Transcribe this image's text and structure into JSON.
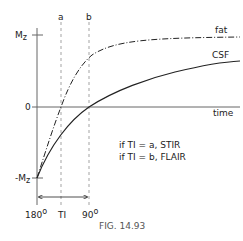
{
  "figure": {
    "caption": "FIG. 14.93",
    "y_axis": {
      "top_label": "M",
      "top_label_sub": "z",
      "zero_label": "0",
      "bottom_label": "-M",
      "bottom_label_sub": "z"
    },
    "x_axis": {
      "label": "time"
    },
    "markers": [
      {
        "id": "a",
        "label": "a"
      },
      {
        "id": "b",
        "label": "b"
      }
    ],
    "curves": [
      {
        "name": "fat",
        "label": "fat",
        "style": "dash-dot"
      },
      {
        "name": "CSF",
        "label": "CSF",
        "style": "solid"
      }
    ],
    "ti_arrow": {
      "start_label": "180",
      "start_sup": "o",
      "middle_label": "TI",
      "end_label": "90",
      "end_sup": "o"
    },
    "notes": [
      "if TI = a, STIR",
      "if TI = b, FLAIR"
    ],
    "colors": {
      "line": "#222222",
      "axis": "#666666",
      "dashed": "#999999",
      "caption": "#555555"
    }
  }
}
